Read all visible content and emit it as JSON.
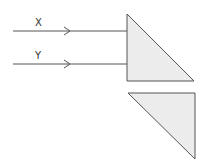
{
  "diagram": {
    "rays": [
      {
        "label": "X",
        "y": 31
      },
      {
        "label": "Y",
        "y": 64
      }
    ],
    "colors": {
      "stroke": "#555555",
      "prism_fill": "#ececec",
      "background": "#ffffff"
    },
    "prisms": [
      {
        "name": "upper-prism",
        "points": "127,14 127,81 194,81"
      },
      {
        "name": "lower-prism",
        "points": "128,93 195,93 195,159"
      }
    ]
  }
}
